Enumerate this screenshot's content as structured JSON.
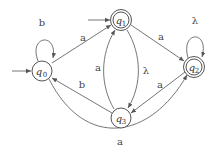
{
  "diagram": {
    "type": "finite_automaton",
    "colors": {
      "stroke": "#666666",
      "text": "#444444",
      "background": "#ffffff"
    },
    "states": [
      {
        "id": "q0",
        "name": "q",
        "sub": "0",
        "initial": true,
        "accepting": false
      },
      {
        "id": "q1",
        "name": "q",
        "sub": "1",
        "initial": true,
        "accepting": true
      },
      {
        "id": "q2",
        "name": "q",
        "sub": "2",
        "initial": false,
        "accepting": true
      },
      {
        "id": "q3",
        "name": "q",
        "sub": "3",
        "initial": false,
        "accepting": false
      }
    ],
    "transitions": [
      {
        "from": "q0",
        "to": "q0",
        "label": "b"
      },
      {
        "from": "q0",
        "to": "q1",
        "label": "a"
      },
      {
        "from": "q0",
        "to": "q2",
        "label": "a"
      },
      {
        "from": "q1",
        "to": "q2",
        "label": "a"
      },
      {
        "from": "q1",
        "to": "q3",
        "label": "λ"
      },
      {
        "from": "q3",
        "to": "q1",
        "label": "a"
      },
      {
        "from": "q3",
        "to": "q0",
        "label": "b"
      },
      {
        "from": "q2",
        "to": "q3",
        "label": "a"
      },
      {
        "from": "q2",
        "to": "q2",
        "label": "λ"
      }
    ]
  }
}
